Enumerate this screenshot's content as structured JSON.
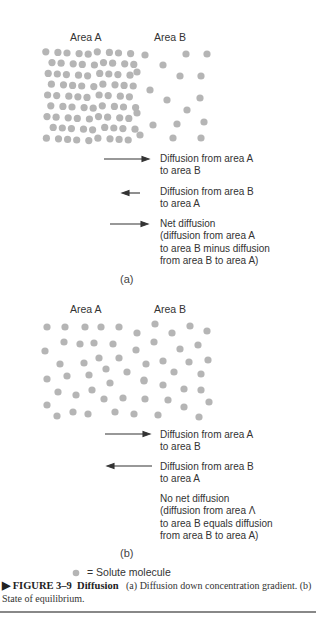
{
  "panel_a": {
    "area_a_label": "Area A",
    "area_b_label": "Area B",
    "legend": [
      {
        "arrow": "long-right",
        "text": "Diffusion from area A\nto area B"
      },
      {
        "arrow": "short-left",
        "text": "Diffusion from area B\nto area A"
      },
      {
        "arrow": "medium-right",
        "text": "Net diffusion\n(diffusion from area A\nto area B minus diffusion\nfrom area B to area A)"
      }
    ],
    "letter": "(a)"
  },
  "panel_b": {
    "area_a_label": "Area A",
    "area_b_label": "Area B",
    "legend": [
      {
        "arrow": "long-right",
        "text": "Diffusion from area A\nto area B"
      },
      {
        "arrow": "long-left",
        "text": "Diffusion from area B\nto area A"
      },
      {
        "arrow": "none",
        "text": "No net diffusion\n(diffusion from area Λ\nto area B equals diffusion\nfrom area B to area A)"
      }
    ],
    "letter": "(b)"
  },
  "key": {
    "symbol": "=",
    "text": "Solute molecule"
  },
  "caption": {
    "marker": "▶",
    "figure_label": "FIGURE 3–9",
    "title": "Diffusion",
    "text": "(a) Diffusion down concentration gradient. (b) State of equilibrium."
  },
  "colors": {
    "molecule": "#b5b5b5",
    "arrow": "#333333",
    "text": "#333333"
  }
}
